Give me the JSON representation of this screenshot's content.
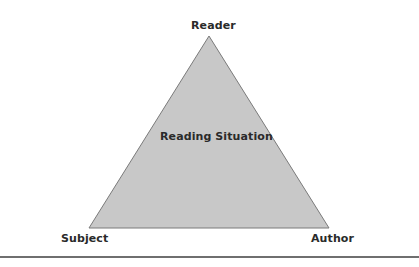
{
  "diagram": {
    "title": "Reading Situation",
    "vertices": {
      "top": "Reader",
      "bottom_left": "Subject",
      "bottom_right": "Author"
    },
    "colors": {
      "fill": "#c8c8c8",
      "stroke": "#7a7a7a",
      "text": "#2a2a2a",
      "rule": "#6f6f6f"
    }
  }
}
